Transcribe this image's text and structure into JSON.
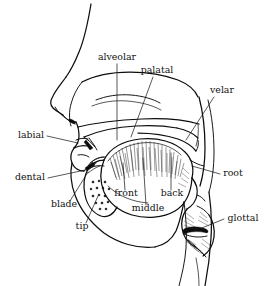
{
  "figure": {
    "type": "anatomical-diagram",
    "background_color": "#ffffff",
    "ink_color": "#0d0d0d",
    "label_color": "#111111"
  },
  "labels": {
    "alveolar": "alveolar",
    "palatal": "palatal",
    "velar": "velar",
    "labial": "labial",
    "dental": "dental",
    "blade": "blade",
    "tip": "tip",
    "front": "front",
    "middle": "middle",
    "back": "back",
    "root": "root",
    "glottal": "glottal"
  },
  "label_positions": {
    "alveolar": {
      "x": 117,
      "y": 60,
      "anchor": "middle"
    },
    "palatal": {
      "x": 157,
      "y": 73,
      "anchor": "middle"
    },
    "velar": {
      "x": 222,
      "y": 93,
      "anchor": "middle"
    },
    "labial": {
      "x": 31,
      "y": 138,
      "anchor": "middle"
    },
    "dental": {
      "x": 30,
      "y": 180,
      "anchor": "middle"
    },
    "blade": {
      "x": 64,
      "y": 207,
      "anchor": "middle"
    },
    "tip": {
      "x": 82,
      "y": 229,
      "anchor": "middle"
    },
    "front": {
      "x": 126,
      "y": 196,
      "anchor": "middle"
    },
    "middle": {
      "x": 148,
      "y": 211,
      "anchor": "middle"
    },
    "back": {
      "x": 172,
      "y": 196,
      "anchor": "middle"
    },
    "root": {
      "x": 233,
      "y": 176,
      "anchor": "middle"
    },
    "glottal": {
      "x": 243,
      "y": 221,
      "anchor": "middle"
    }
  },
  "anatomy_parts": [
    "forehead-nose-profile",
    "nasal-cavity",
    "hard-palate",
    "soft-palate-velum",
    "uvula",
    "upper-lip",
    "lower-lip",
    "upper-teeth",
    "lower-teeth",
    "tongue-body",
    "tongue-tip",
    "tongue-blade",
    "pharyngeal-wall",
    "epiglottis",
    "larynx",
    "vocal-folds",
    "jaw-chin-outline",
    "neck-outline"
  ]
}
